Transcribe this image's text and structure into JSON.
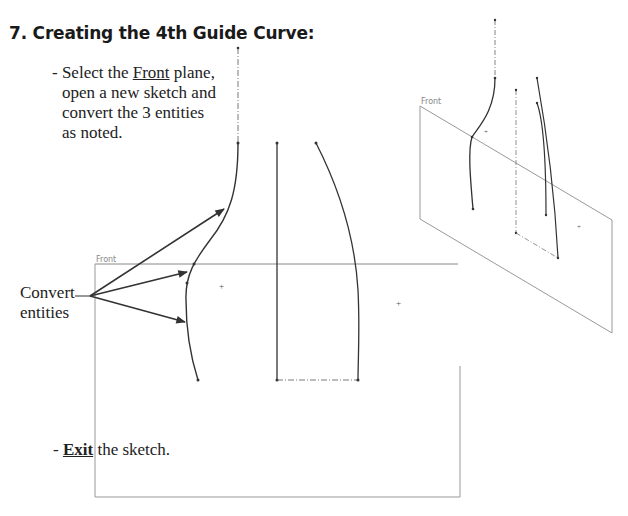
{
  "heading": "7. Creating the 4th Guide Curve:",
  "instruction": {
    "prefix": "- Select the ",
    "plane_name": "Front",
    "line1_rest": " plane,",
    "line2": "open a new sketch and",
    "line3": "convert the 3 entities",
    "line4": "as noted."
  },
  "callout": {
    "line1": "Convert",
    "line2": "entities"
  },
  "exit": {
    "prefix": "- ",
    "action": "Exit",
    "rest": " the sketch."
  },
  "front_view": {
    "plane_label": "Front"
  },
  "iso_view": {
    "plane_label": "Front"
  },
  "colors": {
    "text": "#222222",
    "curve": "#333333",
    "plane_edge": "#999999"
  }
}
